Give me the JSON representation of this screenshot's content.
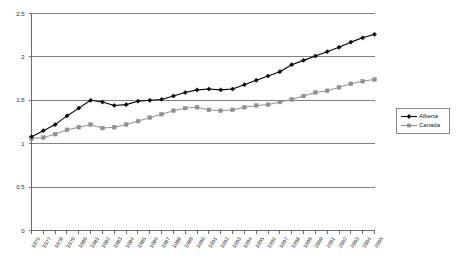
{
  "chart_data": {
    "type": "line",
    "title": "",
    "xlabel": "",
    "ylabel": "",
    "ylim": [
      0,
      2.5
    ],
    "yticks": [
      "0",
      "0.5",
      "1",
      "1.5",
      "2",
      "2.5"
    ],
    "ytick_values": [
      0,
      0.5,
      1,
      1.5,
      2,
      2.5
    ],
    "grid": "horizontal",
    "legend_position": "right",
    "categories": [
      "1976",
      "1977",
      "1978",
      "1979",
      "1980",
      "1981",
      "1982",
      "1983",
      "1984",
      "1985",
      "1986",
      "1987",
      "1988",
      "1989",
      "1990",
      "1991",
      "1992",
      "1993",
      "1994",
      "1995",
      "1996",
      "1997",
      "1998",
      "1999",
      "2000",
      "2001",
      "2002",
      "2003",
      "2004",
      "2005"
    ],
    "series": [
      {
        "name": "Alberta",
        "color": "#000000",
        "marker": "diamond",
        "values": [
          1.08,
          1.15,
          1.22,
          1.32,
          1.41,
          1.5,
          1.48,
          1.44,
          1.45,
          1.49,
          1.5,
          1.51,
          1.55,
          1.59,
          1.62,
          1.63,
          1.62,
          1.63,
          1.68,
          1.73,
          1.78,
          1.83,
          1.91,
          1.96,
          2.01,
          2.06,
          2.11,
          2.17,
          2.22,
          2.26
        ]
      },
      {
        "name": "Canada",
        "color": "#909090",
        "marker": "square",
        "values": [
          1.06,
          1.07,
          1.11,
          1.16,
          1.19,
          1.22,
          1.18,
          1.19,
          1.22,
          1.26,
          1.3,
          1.34,
          1.38,
          1.41,
          1.42,
          1.39,
          1.38,
          1.39,
          1.42,
          1.44,
          1.45,
          1.48,
          1.51,
          1.55,
          1.59,
          1.61,
          1.65,
          1.69,
          1.72,
          1.74
        ]
      }
    ]
  },
  "legend": {
    "items": [
      {
        "label": "Alberta"
      },
      {
        "label": "Canada"
      }
    ]
  }
}
